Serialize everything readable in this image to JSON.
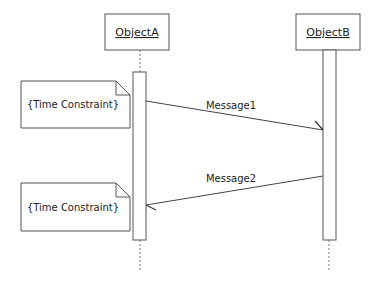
{
  "diagram": {
    "type": "sequence",
    "objects": [
      {
        "id": "objA",
        "label": "ObjectA"
      },
      {
        "id": "objB",
        "label": "ObjectB"
      }
    ],
    "messages": [
      {
        "label": "Message1",
        "from": "ObjectA",
        "to": "ObjectB"
      },
      {
        "label": "Message2",
        "from": "ObjectB",
        "to": "ObjectA"
      }
    ],
    "notes": [
      {
        "label": "{Time Constraint}"
      },
      {
        "label": "{Time Constraint}"
      }
    ],
    "colors": {
      "line": "#555555",
      "background": "#ffffff",
      "text": "#222222"
    }
  }
}
